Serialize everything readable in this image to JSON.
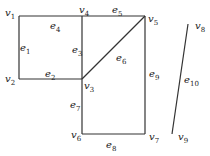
{
  "graph": {
    "vertices": [
      {
        "id": "v1",
        "label": "v",
        "sub": "1",
        "x": 19,
        "y": 16,
        "lx": 5,
        "ly": 8
      },
      {
        "id": "v2",
        "label": "v",
        "sub": "2",
        "x": 19,
        "y": 79,
        "lx": 5,
        "ly": 74
      },
      {
        "id": "v3",
        "label": "v",
        "sub": "3",
        "x": 82,
        "y": 79,
        "lx": 84,
        "ly": 81
      },
      {
        "id": "v4",
        "label": "v",
        "sub": "4",
        "x": 82,
        "y": 16,
        "lx": 79,
        "ly": 5
      },
      {
        "id": "v5",
        "label": "v",
        "sub": "5",
        "x": 145,
        "y": 16,
        "lx": 148,
        "ly": 14
      },
      {
        "id": "v6",
        "label": "v",
        "sub": "6",
        "x": 82,
        "y": 134,
        "lx": 71,
        "ly": 130
      },
      {
        "id": "v7",
        "label": "v",
        "sub": "7",
        "x": 145,
        "y": 134,
        "lx": 149,
        "ly": 132
      },
      {
        "id": "v8",
        "label": "v",
        "sub": "8",
        "x": 188,
        "y": 24,
        "lx": 195,
        "ly": 21
      },
      {
        "id": "v9",
        "label": "v",
        "sub": "9",
        "x": 172,
        "y": 134,
        "lx": 178,
        "ly": 132
      }
    ],
    "edges": [
      {
        "id": "e1",
        "label": "e",
        "sub": "1",
        "from": "v1",
        "to": "v2",
        "lx": 20,
        "ly": 43
      },
      {
        "id": "e2",
        "label": "e",
        "sub": "2",
        "from": "v2",
        "to": "v3",
        "lx": 45,
        "ly": 69
      },
      {
        "id": "e3",
        "label": "e",
        "sub": "3",
        "from": "v4",
        "to": "v3",
        "lx": 72,
        "ly": 45
      },
      {
        "id": "e4",
        "label": "e",
        "sub": "4",
        "from": "v1",
        "to": "v4",
        "lx": 50,
        "ly": 21
      },
      {
        "id": "e5",
        "label": "e",
        "sub": "5",
        "from": "v4",
        "to": "v5",
        "lx": 112,
        "ly": 5
      },
      {
        "id": "e6",
        "label": "e",
        "sub": "6",
        "from": "v3",
        "to": "v5",
        "lx": 116,
        "ly": 53
      },
      {
        "id": "e7",
        "label": "e",
        "sub": "7",
        "from": "v3",
        "to": "v6",
        "lx": 70,
        "ly": 100
      },
      {
        "id": "e8",
        "label": "e",
        "sub": "8",
        "from": "v6",
        "to": "v7",
        "lx": 106,
        "ly": 140
      },
      {
        "id": "e9",
        "label": "e",
        "sub": "9",
        "from": "v5",
        "to": "v7",
        "lx": 149,
        "ly": 69
      },
      {
        "id": "e10",
        "label": "e",
        "sub": "10",
        "from": "v8",
        "to": "v9",
        "lx": 184,
        "ly": 75
      }
    ],
    "line_color": "#333333"
  }
}
